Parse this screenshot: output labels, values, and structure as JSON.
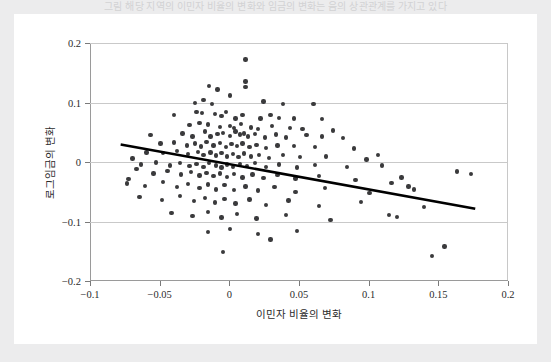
{
  "top_caption": "그림 해당 지역의 이민자 비율의 변화와 임금의 변화는 음의 상관관계를 가지고 있다",
  "figure": {
    "ylabel": "로그임금의 변화",
    "xlabel": "이민자 비율의 변화"
  },
  "chart_data": {
    "type": "scatter",
    "title": "",
    "xlabel": "이민자 비율의 변화",
    "ylabel": "로그임금의 변화",
    "xlim": [
      -0.1,
      0.2
    ],
    "ylim": [
      -0.2,
      0.2
    ],
    "xticks": [
      -0.1,
      -0.05,
      0,
      0.05,
      0.1,
      0.15,
      0.2
    ],
    "xtick_labels": [
      "−0.1",
      "−0.05",
      "0",
      "0.05",
      "0.1",
      "0.15",
      "0.2"
    ],
    "yticks": [
      0.2,
      0.1,
      0,
      -0.1,
      -0.2
    ],
    "ytick_labels": [
      "0.2",
      "0.1",
      "0",
      "−0.1",
      "−0.2"
    ],
    "grid": "horizontal",
    "legend": "none",
    "marker_color": "#3a3a3c",
    "fit_line_color": "#000000",
    "fit_line": {
      "type": "linear-regression",
      "x_start": -0.078,
      "y_start": 0.0295,
      "x_end": 0.1765,
      "y_end": -0.0785
    },
    "points": [
      [
        0.0115,
        0.172
      ],
      [
        0.0115,
        0.135
      ],
      [
        0.0115,
        0.126
      ],
      [
        -0.0145,
        0.128
      ],
      [
        -0.0085,
        0.122
      ],
      [
        0.0005,
        0.112
      ],
      [
        -0.0185,
        0.104
      ],
      [
        -0.0245,
        0.099
      ],
      [
        -0.0125,
        0.097
      ],
      [
        0.0245,
        0.102
      ],
      [
        0.0385,
        0.097
      ],
      [
        0.0605,
        0.098
      ],
      [
        -0.0395,
        0.079
      ],
      [
        -0.0235,
        0.084
      ],
      [
        -0.0195,
        0.082
      ],
      [
        -0.0105,
        0.081
      ],
      [
        -0.0055,
        0.077
      ],
      [
        -0.0025,
        0.084
      ],
      [
        0.0045,
        0.073
      ],
      [
        0.0095,
        0.079
      ],
      [
        0.0225,
        0.073
      ],
      [
        0.0295,
        0.079
      ],
      [
        0.0355,
        0.074
      ],
      [
        0.0465,
        0.073
      ],
      [
        0.0665,
        0.072
      ],
      [
        -0.0285,
        0.062
      ],
      [
        -0.0215,
        0.066
      ],
      [
        -0.0155,
        0.063
      ],
      [
        -0.0065,
        0.059
      ],
      [
        0.0005,
        0.061
      ],
      [
        0.0035,
        0.057
      ],
      [
        0.0085,
        0.064
      ],
      [
        0.0155,
        0.058
      ],
      [
        0.0205,
        0.055
      ],
      [
        0.0305,
        0.061
      ],
      [
        0.0435,
        0.057
      ],
      [
        0.0525,
        0.055
      ],
      [
        0.0745,
        0.053
      ],
      [
        -0.0565,
        0.045
      ],
      [
        -0.0335,
        0.048
      ],
      [
        -0.0265,
        0.043
      ],
      [
        -0.0175,
        0.051
      ],
      [
        -0.0135,
        0.043
      ],
      [
        -0.0085,
        0.047
      ],
      [
        -0.0045,
        0.049
      ],
      [
        0.0005,
        0.044
      ],
      [
        0.0045,
        0.051
      ],
      [
        0.0075,
        0.046
      ],
      [
        0.0105,
        0.048
      ],
      [
        0.0135,
        0.043
      ],
      [
        0.0185,
        0.047
      ],
      [
        0.0255,
        0.041
      ],
      [
        0.0335,
        0.046
      ],
      [
        0.0405,
        0.041
      ],
      [
        0.0555,
        0.045
      ],
      [
        0.0665,
        0.043
      ],
      [
        0.0815,
        0.04
      ],
      [
        -0.0495,
        0.031
      ],
      [
        -0.0395,
        0.033
      ],
      [
        -0.0305,
        0.028
      ],
      [
        -0.0245,
        0.031
      ],
      [
        -0.0205,
        0.026
      ],
      [
        -0.0165,
        0.034
      ],
      [
        -0.0115,
        0.028
      ],
      [
        -0.0065,
        0.032
      ],
      [
        -0.0025,
        0.025
      ],
      [
        0.0015,
        0.03
      ],
      [
        0.0055,
        0.027
      ],
      [
        0.0095,
        0.031
      ],
      [
        0.0145,
        0.025
      ],
      [
        0.0195,
        0.029
      ],
      [
        0.0265,
        0.024
      ],
      [
        0.0345,
        0.028
      ],
      [
        0.0465,
        0.027
      ],
      [
        0.0615,
        0.025
      ],
      [
        0.0895,
        0.023
      ],
      [
        -0.0595,
        0.016
      ],
      [
        -0.0475,
        0.015
      ],
      [
        -0.0375,
        0.018
      ],
      [
        -0.0295,
        0.013
      ],
      [
        -0.0225,
        0.017
      ],
      [
        -0.0185,
        0.012
      ],
      [
        -0.0135,
        0.016
      ],
      [
        -0.0095,
        0.011
      ],
      [
        -0.0055,
        0.015
      ],
      [
        -0.0015,
        0.009
      ],
      [
        0.0025,
        0.013
      ],
      [
        0.0065,
        0.008
      ],
      [
        0.0105,
        0.014
      ],
      [
        0.0155,
        0.009
      ],
      [
        0.0215,
        0.012
      ],
      [
        0.0285,
        0.007
      ],
      [
        0.0385,
        0.012
      ],
      [
        0.0505,
        0.008
      ],
      [
        0.0695,
        0.009
      ],
      [
        0.0985,
        0.004
      ],
      [
        -0.0635,
        -0.004
      ],
      [
        -0.0525,
        -0.001
      ],
      [
        -0.0425,
        -0.006
      ],
      [
        -0.0355,
        -0.002
      ],
      [
        -0.0285,
        -0.007
      ],
      [
        -0.0235,
        -0.003
      ],
      [
        -0.0185,
        -0.008
      ],
      [
        -0.0145,
        -0.002
      ],
      [
        -0.0095,
        -0.006
      ],
      [
        -0.0055,
        -0.009
      ],
      [
        -0.0015,
        -0.004
      ],
      [
        0.0025,
        -0.008
      ],
      [
        0.0075,
        -0.003
      ],
      [
        0.0125,
        -0.007
      ],
      [
        0.0185,
        -0.002
      ],
      [
        0.0265,
        -0.008
      ],
      [
        0.0355,
        -0.004
      ],
      [
        0.0485,
        -0.009
      ],
      [
        0.0615,
        -0.005
      ],
      [
        0.0845,
        -0.008
      ],
      [
        0.1095,
        -0.006
      ],
      [
        -0.0545,
        -0.019
      ],
      [
        -0.0445,
        -0.015
      ],
      [
        -0.0345,
        -0.021
      ],
      [
        -0.0275,
        -0.017
      ],
      [
        -0.0215,
        -0.023
      ],
      [
        -0.0165,
        -0.018
      ],
      [
        -0.0115,
        -0.024
      ],
      [
        -0.0065,
        -0.019
      ],
      [
        -0.0015,
        -0.025
      ],
      [
        0.0035,
        -0.02
      ],
      [
        0.0095,
        -0.026
      ],
      [
        0.0165,
        -0.021
      ],
      [
        0.0245,
        -0.027
      ],
      [
        0.0345,
        -0.022
      ],
      [
        0.0475,
        -0.028
      ],
      [
        0.0645,
        -0.024
      ],
      [
        0.0905,
        -0.03
      ],
      [
        0.1235,
        -0.026
      ],
      [
        -0.0735,
        -0.036
      ],
      [
        -0.0605,
        -0.04
      ],
      [
        -0.0475,
        -0.034
      ],
      [
        -0.0375,
        -0.042
      ],
      [
        -0.0295,
        -0.037
      ],
      [
        -0.0215,
        -0.044
      ],
      [
        -0.0155,
        -0.038
      ],
      [
        -0.0095,
        -0.046
      ],
      [
        -0.0035,
        -0.039
      ],
      [
        0.0035,
        -0.047
      ],
      [
        0.0115,
        -0.041
      ],
      [
        0.0205,
        -0.048
      ],
      [
        0.0325,
        -0.042
      ],
      [
        0.0475,
        -0.05
      ],
      [
        0.0685,
        -0.044
      ],
      [
        0.1005,
        -0.052
      ],
      [
        0.1325,
        -0.046
      ],
      [
        -0.0645,
        -0.059
      ],
      [
        -0.0485,
        -0.064
      ],
      [
        -0.0355,
        -0.057
      ],
      [
        -0.0255,
        -0.066
      ],
      [
        -0.0175,
        -0.06
      ],
      [
        -0.0105,
        -0.068
      ],
      [
        -0.0035,
        -0.062
      ],
      [
        0.0045,
        -0.07
      ],
      [
        0.0145,
        -0.063
      ],
      [
        0.0265,
        -0.072
      ],
      [
        0.0425,
        -0.065
      ],
      [
        0.0645,
        -0.074
      ],
      [
        0.0945,
        -0.067
      ],
      [
        0.1395,
        -0.076
      ],
      [
        -0.0415,
        -0.086
      ],
      [
        -0.0265,
        -0.091
      ],
      [
        -0.0155,
        -0.084
      ],
      [
        -0.0055,
        -0.093
      ],
      [
        0.0055,
        -0.087
      ],
      [
        0.0195,
        -0.095
      ],
      [
        0.0405,
        -0.089
      ],
      [
        0.0725,
        -0.097
      ],
      [
        0.1635,
        -0.016
      ],
      [
        0.1735,
        -0.02
      ],
      [
        -0.0155,
        -0.118
      ],
      [
        0.0005,
        -0.113
      ],
      [
        0.0205,
        -0.121
      ],
      [
        0.0485,
        -0.116
      ],
      [
        0.1145,
        -0.089
      ],
      [
        0.1205,
        -0.092
      ],
      [
        -0.0045,
        -0.151
      ],
      [
        0.0295,
        -0.13
      ],
      [
        0.1455,
        -0.158
      ],
      [
        0.1545,
        -0.142
      ],
      [
        -0.0725,
        -0.029
      ],
      [
        -0.0695,
        0.006
      ],
      [
        -0.0665,
        -0.012
      ],
      [
        0.1065,
        0.012
      ],
      [
        0.1165,
        -0.035
      ],
      [
        0.1285,
        -0.041
      ]
    ]
  }
}
